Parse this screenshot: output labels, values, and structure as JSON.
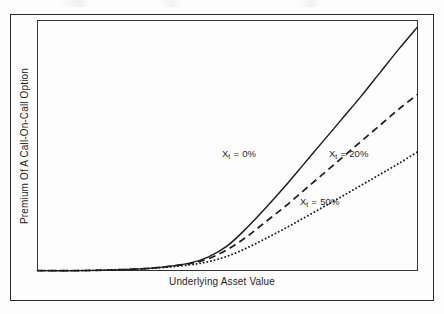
{
  "figure": {
    "background_color": "#fdfdfd",
    "frame_color": "#2a2a2a",
    "plot_border_color": "#333333"
  },
  "axes": {
    "x_label": "Underlying Asset Value",
    "y_label": "Premium Of A Call-On-Call Option"
  },
  "series_labels": [
    {
      "prefix": "X",
      "subscript": "t",
      "suffix": " = 0%"
    },
    {
      "prefix": "X",
      "subscript": "t",
      "suffix": " = 20%"
    },
    {
      "prefix": "X",
      "subscript": "t",
      "suffix": " = 50%"
    }
  ],
  "chart_data": {
    "type": "line",
    "title": "",
    "xlabel": "Underlying Asset Value",
    "ylabel": "Premium Of A Call-On-Call Option",
    "xlim": [
      0,
      100
    ],
    "ylim": [
      0,
      100
    ],
    "grid": false,
    "axis_tick_labels": {
      "x": [],
      "y": []
    },
    "legend": "inline-annotations",
    "legend_position": "inline",
    "line_color": "#1c1c1c",
    "series": [
      {
        "name": "Xt = 0%",
        "style": "solid",
        "label": "X_t = 0%",
        "label_x": 58,
        "label_y": 57,
        "x": [
          0,
          10,
          20,
          30,
          40,
          45,
          50,
          55,
          60,
          65,
          70,
          75,
          80,
          85,
          90,
          95,
          100
        ],
        "y": [
          0,
          0,
          0.3,
          1.0,
          3.0,
          5.5,
          10.0,
          17.0,
          25.0,
          33.5,
          42.5,
          51.5,
          60.5,
          69.5,
          79.0,
          88.5,
          97.5
        ]
      },
      {
        "name": "Xt = 20%",
        "style": "dashed",
        "label": "X_t = 20%",
        "label_x": 88,
        "label_y": 57,
        "x": [
          0,
          10,
          20,
          30,
          40,
          45,
          50,
          55,
          60,
          65,
          70,
          75,
          80,
          85,
          90,
          95,
          100
        ],
        "y": [
          0,
          0,
          0.3,
          1.0,
          2.8,
          4.8,
          8.5,
          13.5,
          19.5,
          25.5,
          32.0,
          38.5,
          45.0,
          51.5,
          58.0,
          64.5,
          70.5
        ]
      },
      {
        "name": "Xt = 50%",
        "style": "dotted",
        "label": "X_t = 50%",
        "label_x": 80,
        "label_y": 27,
        "x": [
          0,
          10,
          20,
          30,
          40,
          45,
          50,
          55,
          60,
          65,
          70,
          75,
          80,
          85,
          90,
          95,
          100
        ],
        "y": [
          0,
          0,
          0.3,
          0.9,
          2.3,
          3.6,
          5.8,
          9.0,
          12.8,
          16.8,
          21.0,
          25.3,
          29.6,
          34.0,
          38.4,
          42.8,
          47.5
        ]
      }
    ]
  }
}
